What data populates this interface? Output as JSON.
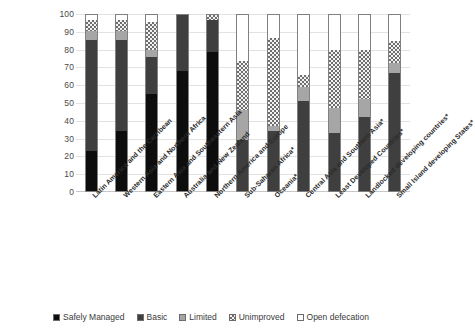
{
  "chart_data": {
    "type": "bar",
    "stacked": true,
    "title": "",
    "xlabel": "",
    "ylabel": "",
    "ylim": [
      0,
      100
    ],
    "yticks": [
      0,
      10,
      20,
      30,
      40,
      50,
      60,
      70,
      80,
      90,
      100
    ],
    "grid": true,
    "legend_position": "bottom",
    "categories": [
      "Latin America and the Carribean",
      "Western Asia and Northern Africa",
      "Eastern Asia and Southeastern Asia",
      "Australia and New Zealand",
      "Northern America and Europe",
      "Sub-Saharan Africa*",
      "Oceania*",
      "Central Asia and Southern Asia*",
      "Least Developed Countries*",
      "Landlocked developing countries*",
      "Small Island developing States*"
    ],
    "series": [
      {
        "name": "Safely Managed",
        "color": "#0d0d0d",
        "pattern": "solid-black",
        "values": [
          23,
          34,
          55,
          68,
          79,
          0,
          0,
          0,
          0,
          0,
          0
        ]
      },
      {
        "name": "Basic",
        "color": "#3f3f3f",
        "pattern": "solid-dark-gray",
        "values": [
          63,
          52,
          21,
          32,
          18,
          29,
          34,
          51,
          33,
          42,
          67
        ]
      },
      {
        "name": "Limited",
        "color": "#a6a6a6",
        "pattern": "solid-light-gray",
        "values": [
          5,
          5,
          4,
          0,
          0,
          17,
          3,
          8,
          14,
          10,
          6
        ]
      },
      {
        "name": "Unimproved",
        "color": "#6e6e6e",
        "pattern": "checkered",
        "values": [
          6,
          6,
          16,
          0,
          3,
          28,
          50,
          7,
          33,
          28,
          12
        ]
      },
      {
        "name": "Open defecation",
        "color": "#ffffff",
        "pattern": "empty-white",
        "values": [
          3,
          3,
          4,
          0,
          0,
          26,
          13,
          34,
          20,
          20,
          15
        ]
      }
    ]
  },
  "legend": {
    "items": [
      {
        "label": "Safely Managed",
        "swatch": "swatch-safely-managed"
      },
      {
        "label": "Basic",
        "swatch": "swatch-basic"
      },
      {
        "label": "Limited",
        "swatch": "swatch-limited"
      },
      {
        "label": "Unimproved",
        "swatch": "swatch-unimproved"
      },
      {
        "label": "Open defecation",
        "swatch": "swatch-open-defecation"
      }
    ]
  }
}
